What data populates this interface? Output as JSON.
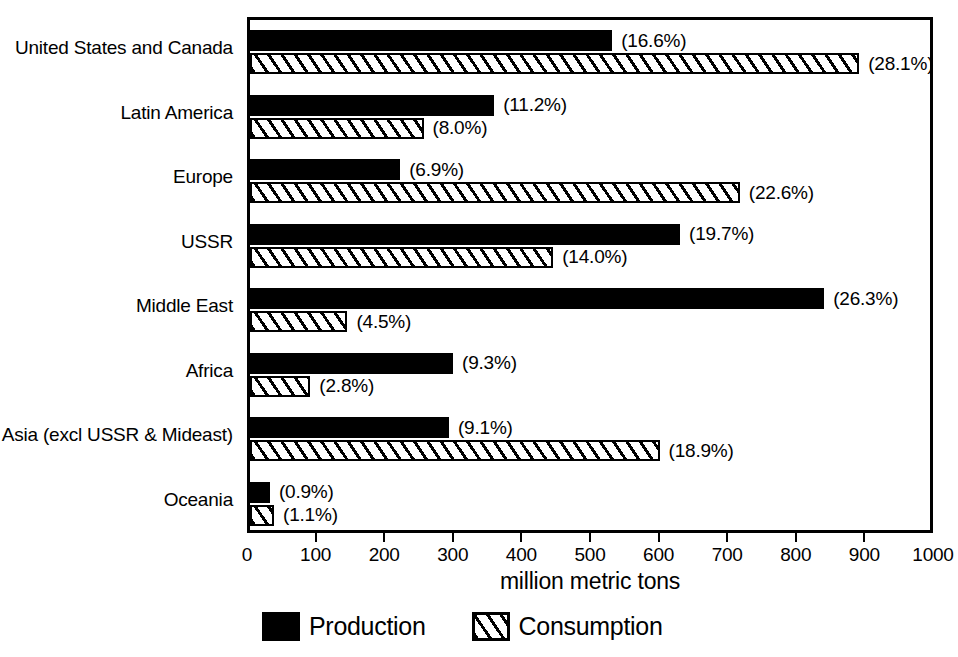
{
  "chart_data": {
    "type": "bar",
    "orientation": "horizontal",
    "title": "",
    "xlabel": "million metric tons",
    "ylabel": "",
    "xlim": [
      0,
      1000
    ],
    "xticks": [
      0,
      100,
      200,
      300,
      400,
      500,
      600,
      700,
      800,
      900,
      1000
    ],
    "xtick_labels": [
      "0",
      "100",
      "200",
      "300",
      "400",
      "500",
      "600",
      "700",
      "800",
      "900",
      "1000"
    ],
    "grid": false,
    "legend_position": "bottom",
    "categories": [
      "United States and Canada",
      "Latin America",
      "Europe",
      "USSR",
      "Middle East",
      "Africa",
      "Asia (excl USSR & Mideast)",
      "Oceania"
    ],
    "series": [
      {
        "name": "Production",
        "style": "solid-black",
        "values": [
          528,
          356,
          219,
          627,
          837,
          296,
          290,
          29
        ],
        "labels": [
          "(16.6%)",
          "(11.2%)",
          "(6.9%)",
          "(19.7%)",
          "(26.3%)",
          "(9.3%)",
          "(9.1%)",
          "(0.9%)"
        ],
        "percents": [
          16.6,
          11.2,
          6.9,
          19.7,
          26.3,
          9.3,
          9.1,
          0.9
        ]
      },
      {
        "name": "Consumption",
        "style": "diagonal-hatch",
        "values": [
          888,
          253,
          714,
          442,
          142,
          88,
          597,
          35
        ],
        "labels": [
          "(28.1%)",
          "(8.0%)",
          "(22.6%)",
          "(14.0%)",
          "(4.5%)",
          "(2.8%)",
          "(18.9%)",
          "(1.1%)"
        ],
        "percents": [
          28.1,
          8.0,
          22.6,
          14.0,
          4.5,
          2.8,
          18.9,
          1.1
        ]
      }
    ]
  },
  "axis": {
    "x_title": "million metric tons"
  },
  "legend": {
    "entries": [
      {
        "label": "Production",
        "swatch": "solid-black"
      },
      {
        "label": "Consumption",
        "swatch": "diagonal-hatch"
      }
    ]
  },
  "colors": {
    "production": "#000000",
    "consumption_outline": "#000000",
    "consumption_fill": "#ffffff",
    "frame": "#000000",
    "background": "#ffffff"
  }
}
